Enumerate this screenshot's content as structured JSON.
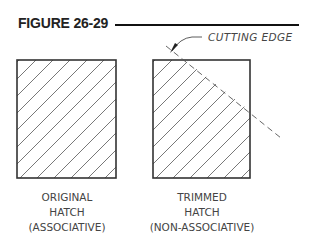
{
  "figure": {
    "title": "FIGURE 26-29",
    "colors": {
      "ink": "#333333",
      "rule": "#111111",
      "background": "#ffffff"
    }
  },
  "callout": {
    "label": "CUTTING EDGE"
  },
  "panels": [
    {
      "id": "original",
      "caption_lines": [
        "ORIGINAL",
        "HATCH",
        "(ASSOCIATIVE)"
      ],
      "hatch_pattern": "diagonal-45"
    },
    {
      "id": "trimmed",
      "caption_lines": [
        "TRIMMED",
        "HATCH",
        "(NON-ASSOCIATIVE)"
      ],
      "hatch_pattern": "diagonal-45-trimmed"
    }
  ]
}
